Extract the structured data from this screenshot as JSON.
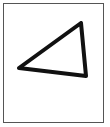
{
  "figure": {
    "shape": "triangle-icon",
    "stroke_color": "#111111",
    "frame_color": "#555555",
    "points": [
      [
        19,
        68
      ],
      [
        81,
        23
      ],
      [
        86,
        76
      ]
    ]
  }
}
